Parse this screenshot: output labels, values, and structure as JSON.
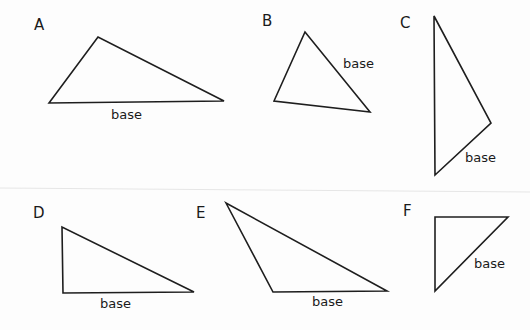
{
  "figure": {
    "width": 530,
    "height": 330,
    "stroke_color": "#1e1e1e",
    "triangles": [
      {
        "id": "A",
        "label": "A",
        "label_pos": [
          34,
          30
        ],
        "points": "49,103 98,37 224,101",
        "base_text": "base",
        "base_pos": [
          111,
          119
        ]
      },
      {
        "id": "B",
        "label": "B",
        "label_pos": [
          262,
          26
        ],
        "points": "274,101 305,32 370,112",
        "base_text": "base",
        "base_pos": [
          343,
          68
        ]
      },
      {
        "id": "C",
        "label": "C",
        "label_pos": [
          400,
          28
        ],
        "points": "434,16 491,123 435,175",
        "base_text": "base",
        "base_pos": [
          465,
          162
        ]
      },
      {
        "id": "D",
        "label": "D",
        "label_pos": [
          33,
          218
        ],
        "points": "62,227 63,293 194,292",
        "base_text": "base",
        "base_pos": [
          100,
          308
        ]
      },
      {
        "id": "E",
        "label": "E",
        "label_pos": [
          196,
          218
        ],
        "points": "226,203 273,292 387,291",
        "base_text": "base",
        "base_pos": [
          312,
          306
        ]
      },
      {
        "id": "F",
        "label": "F",
        "label_pos": [
          403,
          216
        ],
        "points": "435,217 508,217 435,291",
        "base_text": "base",
        "base_pos": [
          474,
          268
        ]
      }
    ]
  }
}
